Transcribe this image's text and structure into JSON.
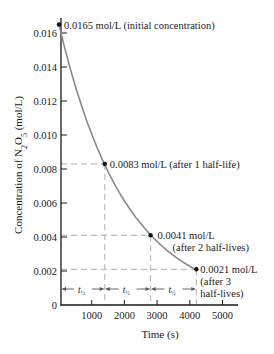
{
  "chart_data": {
    "type": "line",
    "title": "",
    "xlabel": "Time (s)",
    "ylabel": "Concentration of N2O5 (mol/L)",
    "ylabel_parts": {
      "prefix": "Concentration of N",
      "sub1": "2",
      "mid": "O",
      "sub2": "5",
      "suffix": " (mol/L)"
    },
    "xlim": [
      0,
      5400
    ],
    "ylim": [
      0,
      0.017
    ],
    "x_ticks": [
      1000,
      2000,
      3000,
      4000,
      5000
    ],
    "x_tick_labels": [
      "1000",
      "2000",
      "3000",
      "4000",
      "5000"
    ],
    "y_ticks": [
      0,
      0.002,
      0.004,
      0.006,
      0.008,
      0.01,
      0.012,
      0.014,
      0.016
    ],
    "y_tick_labels": [
      "0",
      "0.002",
      "0.004",
      "0.006",
      "0.008",
      "0.010",
      "0.012",
      "0.014",
      "0.016"
    ],
    "grid": false,
    "legend": null,
    "half_life_s": 1400,
    "series": [
      {
        "name": "[N2O5] vs time (first-order decay)",
        "x": [
          0,
          1400,
          2800,
          4200
        ],
        "y": [
          0.0165,
          0.0083,
          0.0041,
          0.0021
        ],
        "curve_color": "#8a8a8a",
        "point_color": "#111111"
      }
    ],
    "annotations": [
      {
        "point": 0,
        "lines": [
          "0.0165 mol/L (initial concentration)"
        ]
      },
      {
        "point": 1,
        "lines": [
          "0.0083 mol/L (after 1 half-life)"
        ]
      },
      {
        "point": 2,
        "lines": [
          "0.0041 mol/L",
          "(after 2 half-lives)"
        ]
      },
      {
        "point": 3,
        "lines": [
          "0.0021 mol/L",
          "(after 3",
          "half-lives)"
        ]
      }
    ],
    "half_life_markers": [
      {
        "from": 0,
        "to": 1400,
        "label": "t",
        "sub": "½"
      },
      {
        "from": 1400,
        "to": 2800,
        "label": "t",
        "sub": "½"
      },
      {
        "from": 2800,
        "to": 4200,
        "label": "t",
        "sub": "½"
      }
    ],
    "colors": {
      "axis": "#1a1a1a",
      "curve": "#8a8a8a",
      "dash": "#bdbdbd",
      "point": "#111111"
    }
  }
}
